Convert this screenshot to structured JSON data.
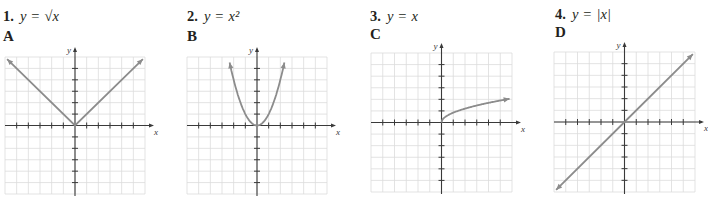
{
  "header": {
    "cut_off_text": ""
  },
  "items": [
    {
      "number": "1.",
      "lhs": "y",
      "op": "=",
      "rhs": "√x"
    },
    {
      "number": "2.",
      "lhs": "y",
      "op": "=",
      "rhs": "x²"
    },
    {
      "number": "3.",
      "lhs": "y",
      "op": "=",
      "rhs": "x"
    },
    {
      "number": "4.",
      "lhs": "y",
      "op": "=",
      "rhs": "|x|"
    }
  ],
  "graphs": [
    {
      "letter": "A",
      "function": "absolute-value",
      "x_axis_label": "x",
      "y_axis_label": "y"
    },
    {
      "letter": "B",
      "function": "parabola",
      "x_axis_label": "x",
      "y_axis_label": "y"
    },
    {
      "letter": "C",
      "function": "square-root",
      "x_axis_label": "x",
      "y_axis_label": "y"
    },
    {
      "letter": "D",
      "function": "identity",
      "x_axis_label": "x",
      "y_axis_label": "y"
    }
  ],
  "colors": {
    "grid": "#dcdcdc",
    "axis": "#3a3a3a",
    "curve": "#8c8c8c",
    "text": "#231f20"
  },
  "chart_data": [
    {
      "type": "line",
      "title": "A",
      "xlabel": "x",
      "ylabel": "y",
      "xlim": [
        -6,
        6
      ],
      "ylim": [
        -6,
        6
      ],
      "grid": true,
      "x": [
        -6,
        0,
        6
      ],
      "series": [
        {
          "name": "A",
          "values": [
            6,
            0,
            6
          ]
        }
      ]
    },
    {
      "type": "line",
      "title": "B",
      "xlabel": "x",
      "ylabel": "y",
      "xlim": [
        -6,
        6
      ],
      "ylim": [
        -6,
        6
      ],
      "grid": true,
      "x": [
        -2.4,
        -2,
        -1,
        0,
        1,
        2,
        2.4
      ],
      "series": [
        {
          "name": "B",
          "values": [
            5.76,
            4,
            1,
            0,
            1,
            4,
            5.76
          ]
        }
      ]
    },
    {
      "type": "line",
      "title": "C",
      "xlabel": "x",
      "ylabel": "y",
      "xlim": [
        -6,
        6
      ],
      "ylim": [
        -6,
        6
      ],
      "grid": true,
      "x": [
        0,
        1,
        2,
        4,
        6
      ],
      "series": [
        {
          "name": "C",
          "values": [
            0,
            1,
            1.41,
            2,
            2.45
          ]
        }
      ]
    },
    {
      "type": "line",
      "title": "D",
      "xlabel": "x",
      "ylabel": "y",
      "xlim": [
        -6,
        6
      ],
      "ylim": [
        -6,
        6
      ],
      "grid": true,
      "x": [
        -6,
        0,
        6
      ],
      "series": [
        {
          "name": "D",
          "values": [
            -6,
            0,
            6
          ]
        }
      ]
    }
  ]
}
